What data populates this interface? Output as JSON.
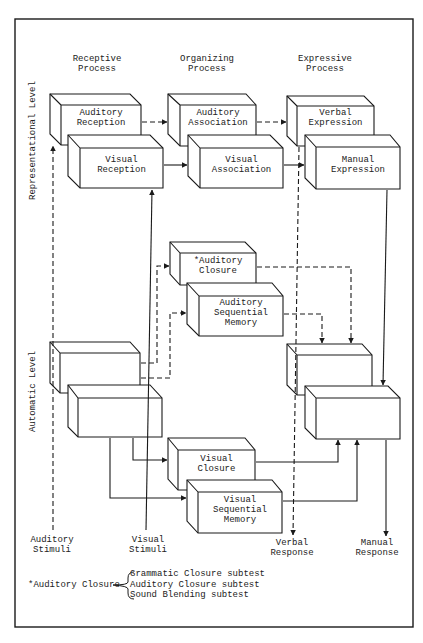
{
  "figure": {
    "column_headers": [
      {
        "line1": "Receptive",
        "line2": "Process"
      },
      {
        "line1": "Organizing",
        "line2": "Process"
      },
      {
        "line1": "Expressive",
        "line2": "Process"
      }
    ],
    "level_labels": {
      "representational": "Representational Level",
      "automatic": "Automatic Level"
    },
    "boxes": {
      "auditory_reception": {
        "line1": "Auditory",
        "line2": "Reception"
      },
      "visual_reception": {
        "line1": "Visual",
        "line2": "Reception"
      },
      "auditory_association": {
        "line1": "Auditory",
        "line2": "Association"
      },
      "visual_association": {
        "line1": "Visual",
        "line2": "Association"
      },
      "verbal_expression": {
        "line1": "Verbal",
        "line2": "Expression"
      },
      "manual_expression": {
        "line1": "Manual",
        "line2": "Expression"
      },
      "auditory_closure": {
        "line1": "*Auditory",
        "line2": "Closure"
      },
      "auditory_sequential_memory": {
        "line1": "Auditory",
        "line2": "Sequential",
        "line3": "Memory"
      },
      "visual_closure": {
        "line1": "Visual",
        "line2": "Closure"
      },
      "visual_sequential_memory": {
        "line1": "Visual",
        "line2": "Sequential",
        "line3": "Memory"
      }
    },
    "io_labels": {
      "auditory_stimuli": {
        "line1": "Auditory",
        "line2": "Stimuli"
      },
      "visual_stimuli": {
        "line1": "Visual",
        "line2": "Stimuli"
      },
      "verbal_response": {
        "line1": "Verbal",
        "line2": "Response"
      },
      "manual_response": {
        "line1": "Manual",
        "line2": "Response"
      }
    },
    "footnote": {
      "term": "*Auditory Closure",
      "items": [
        "Grammatic Closure subtest",
        "Auditory Closure subtest",
        "Sound Blending subtest"
      ]
    },
    "colors": {
      "line": "#1a1a1a",
      "background": "#ffffff"
    }
  }
}
